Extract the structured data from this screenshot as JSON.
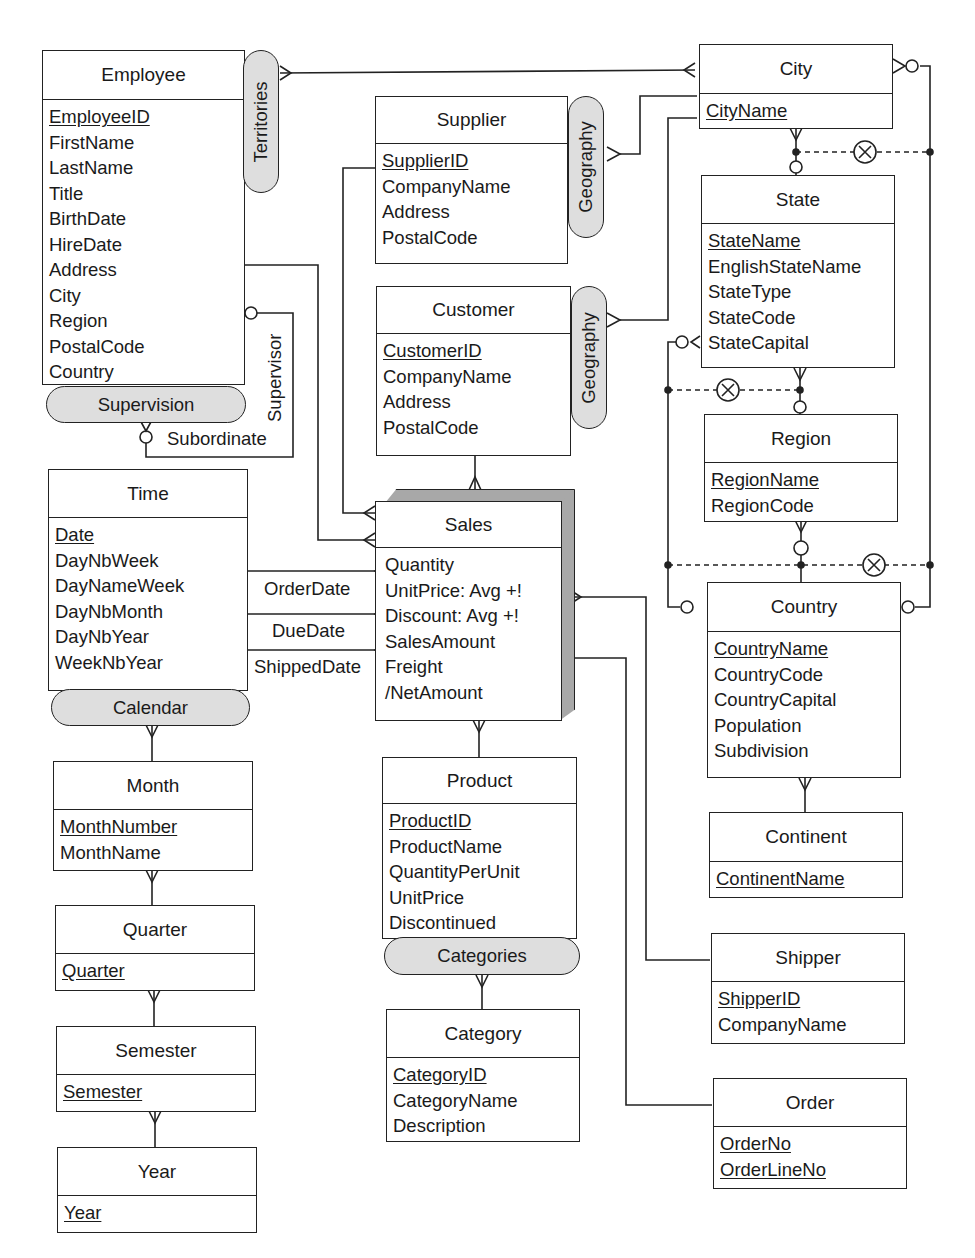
{
  "entities": {
    "employee": {
      "name": "Employee",
      "key": "EmployeeID",
      "attrs": [
        "FirstName",
        "LastName",
        "Title",
        "BirthDate",
        "HireDate",
        "Address",
        "City",
        "Region",
        "PostalCode",
        "Country"
      ]
    },
    "supplier": {
      "name": "Supplier",
      "key": "SupplierID",
      "attrs": [
        "CompanyName",
        "Address",
        "PostalCode"
      ]
    },
    "customer": {
      "name": "Customer",
      "key": "CustomerID",
      "attrs": [
        "CompanyName",
        "Address",
        "PostalCode"
      ]
    },
    "city": {
      "name": "City",
      "key": "CityName"
    },
    "state": {
      "name": "State",
      "key": "StateName",
      "attrs": [
        "EnglishStateName",
        "StateType",
        "StateCode",
        "StateCapital"
      ]
    },
    "region": {
      "name": "Region",
      "key": "RegionName",
      "attrs": [
        "RegionCode"
      ]
    },
    "country": {
      "name": "Country",
      "key": "CountryName",
      "attrs": [
        "CountryCode",
        "CountryCapital",
        "Population",
        "Subdivision"
      ]
    },
    "continent": {
      "name": "Continent",
      "key": "ContinentName"
    },
    "time": {
      "name": "Time",
      "key": "Date",
      "attrs": [
        "DayNbWeek",
        "DayNameWeek",
        "DayNbMonth",
        "DayNbYear",
        "WeekNbYear"
      ]
    },
    "sales": {
      "name": "Sales",
      "measures": [
        "Quantity",
        "UnitPrice: Avg +!",
        "Discount: Avg +!",
        "SalesAmount",
        "Freight",
        "/NetAmount"
      ]
    },
    "month": {
      "name": "Month",
      "key": "MonthNumber",
      "attrs": [
        "MonthName"
      ]
    },
    "quarter": {
      "name": "Quarter",
      "key": "Quarter"
    },
    "semester": {
      "name": "Semester",
      "key": "Semester"
    },
    "year": {
      "name": "Year",
      "key": "Year"
    },
    "product": {
      "name": "Product",
      "key": "ProductID",
      "attrs": [
        "ProductName",
        "QuantityPerUnit",
        "UnitPrice",
        "Discontinued"
      ]
    },
    "category": {
      "name": "Category",
      "key": "CategoryID",
      "attrs": [
        "CategoryName",
        "Description"
      ]
    },
    "shipper": {
      "name": "Shipper",
      "key": "ShipperID",
      "attrs": [
        "CompanyName"
      ]
    },
    "order": {
      "name": "Order",
      "keys": [
        "OrderNo",
        "OrderLineNo"
      ]
    }
  },
  "hierarchies": {
    "territories": "Territories",
    "supervision": "Supervision",
    "geography_supplier": "Geography",
    "geography_customer": "Geography",
    "calendar": "Calendar",
    "categories": "Categories"
  },
  "roles": {
    "supervisor": "Supervisor",
    "subordinate": "Subordinate",
    "order_date": "OrderDate",
    "due_date": "DueDate",
    "shipped_date": "ShippedDate"
  },
  "styles": {
    "line_color": "#222222",
    "pill_fill": "#dedede",
    "fact_shade": "#a8a8a8"
  }
}
